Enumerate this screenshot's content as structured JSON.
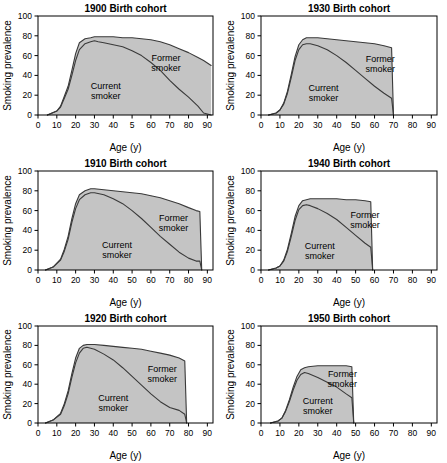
{
  "figure": {
    "axis_labels": {
      "x": "Age (y)",
      "y": "Smoking prevalence"
    },
    "band_labels": {
      "current": "Current smoker",
      "former": "Former smoker"
    },
    "colors": {
      "fill": "#c8c8c8",
      "line": "#3a3a3a",
      "axis": "#000000",
      "background": "#ffffff"
    }
  },
  "chart_data": [
    {
      "type": "area",
      "title": "1900 Birth cohort",
      "xlabel": "Age (y)",
      "ylabel": "Smoking prevalence",
      "xlim": [
        0,
        93
      ],
      "ylim": [
        0,
        100
      ],
      "xticks": [
        0,
        10,
        20,
        30,
        40,
        50,
        60,
        70,
        80,
        90
      ],
      "xticklabels": [
        "0",
        "10",
        "20",
        "30",
        "40",
        "5",
        "60",
        "70",
        "80",
        "90"
      ],
      "yticks": [
        0,
        20,
        40,
        60,
        80,
        100
      ],
      "grid": false,
      "legend": "inline-annotations",
      "x": [
        5,
        10,
        12,
        14,
        16,
        18,
        20,
        22,
        25,
        28,
        30,
        32,
        35,
        40,
        45,
        50,
        55,
        60,
        65,
        70,
        75,
        80,
        85,
        88,
        92
      ],
      "series": [
        {
          "name": "Current smoker",
          "values": [
            0,
            4,
            8,
            17,
            26,
            40,
            55,
            66,
            72,
            74,
            75,
            74,
            73,
            71,
            69,
            65,
            60,
            53,
            45,
            35,
            26,
            18,
            9,
            2,
            0
          ]
        },
        {
          "name": "Total (Current + Former)",
          "values": [
            0,
            4,
            9,
            19,
            29,
            45,
            62,
            73,
            77,
            78,
            79,
            79,
            79,
            79,
            78,
            78,
            77,
            76,
            74,
            71,
            67,
            63,
            58,
            55,
            50
          ]
        }
      ]
    },
    {
      "type": "area",
      "title": "1930 Birth cohort",
      "xlabel": "Age (y)",
      "ylabel": "Smoking prevalence",
      "xlim": [
        0,
        93
      ],
      "ylim": [
        0,
        100
      ],
      "xticks": [
        0,
        10,
        20,
        30,
        40,
        50,
        60,
        70,
        80,
        90
      ],
      "xticklabels": [
        "0",
        "10",
        "20",
        "30",
        "40",
        "50",
        "60",
        "70",
        "80",
        "90"
      ],
      "yticks": [
        0,
        20,
        40,
        60,
        80,
        100
      ],
      "grid": false,
      "legend": "inline-annotations",
      "x": [
        4,
        8,
        10,
        12,
        14,
        16,
        18,
        20,
        22,
        24,
        26,
        30,
        35,
        40,
        45,
        50,
        55,
        60,
        65,
        69,
        70
      ],
      "series": [
        {
          "name": "Current smoker",
          "values": [
            0,
            2,
            5,
            11,
            22,
            38,
            55,
            66,
            71,
            72,
            72,
            70,
            66,
            60,
            53,
            45,
            37,
            29,
            22,
            17,
            0
          ]
        },
        {
          "name": "Total (Current + Former)",
          "values": [
            0,
            2,
            5,
            12,
            24,
            41,
            59,
            71,
            76,
            78,
            78,
            78,
            77,
            76,
            75,
            74,
            73,
            72,
            70,
            68,
            0
          ]
        }
      ]
    },
    {
      "type": "area",
      "title": "1910 Birth cohort",
      "xlabel": "Age (y)",
      "ylabel": "Smoking prevalence",
      "xlim": [
        0,
        93
      ],
      "ylim": [
        0,
        100
      ],
      "xticks": [
        0,
        10,
        20,
        30,
        40,
        50,
        60,
        70,
        80,
        90
      ],
      "xticklabels": [
        "0",
        "10",
        "20",
        "30",
        "40",
        "50",
        "60",
        "70",
        "80",
        "90"
      ],
      "yticks": [
        0,
        20,
        40,
        60,
        80,
        100
      ],
      "grid": false,
      "legend": "inline-annotations",
      "x": [
        4,
        8,
        12,
        14,
        16,
        18,
        20,
        22,
        25,
        28,
        30,
        35,
        40,
        45,
        50,
        55,
        60,
        65,
        70,
        75,
        80,
        84,
        86,
        87
      ],
      "series": [
        {
          "name": "Current smoker",
          "values": [
            0,
            3,
            10,
            19,
            31,
            48,
            62,
            71,
            76,
            78,
            78,
            76,
            72,
            67,
            60,
            52,
            43,
            34,
            26,
            18,
            12,
            9,
            9,
            0
          ]
        },
        {
          "name": "Total (Current + Former)",
          "values": [
            0,
            3,
            11,
            21,
            34,
            52,
            67,
            76,
            80,
            82,
            82,
            81,
            80,
            79,
            78,
            77,
            75,
            73,
            70,
            67,
            63,
            60,
            59,
            0
          ]
        }
      ]
    },
    {
      "type": "area",
      "title": "1940 Birth cohort",
      "xlabel": "Age (y)",
      "ylabel": "Smoking prevalence",
      "xlim": [
        0,
        93
      ],
      "ylim": [
        0,
        100
      ],
      "xticks": [
        0,
        10,
        20,
        30,
        40,
        50,
        60,
        70,
        80,
        90
      ],
      "xticklabels": [
        "0",
        "10",
        "20",
        "30",
        "40",
        "50",
        "60",
        "70",
        "80",
        "90"
      ],
      "yticks": [
        0,
        20,
        40,
        60,
        80,
        100
      ],
      "grid": false,
      "legend": "inline-annotations",
      "x": [
        4,
        8,
        10,
        12,
        14,
        16,
        18,
        20,
        22,
        24,
        26,
        30,
        35,
        40,
        45,
        50,
        55,
        58,
        59
      ],
      "series": [
        {
          "name": "Current smoker",
          "values": [
            0,
            2,
            4,
            9,
            19,
            34,
            50,
            61,
            65,
            66,
            65,
            62,
            57,
            51,
            43,
            35,
            27,
            23,
            0
          ]
        },
        {
          "name": "Total (Current + Former)",
          "values": [
            0,
            2,
            4,
            10,
            21,
            37,
            54,
            65,
            70,
            71,
            72,
            72,
            72,
            72,
            71,
            71,
            70,
            69,
            0
          ]
        }
      ]
    },
    {
      "type": "area",
      "title": "1920 Birth cohort",
      "xlabel": "Age (y)",
      "ylabel": "Smoking prevalence",
      "xlim": [
        0,
        93
      ],
      "ylim": [
        0,
        100
      ],
      "xticks": [
        0,
        10,
        20,
        30,
        40,
        50,
        60,
        70,
        80,
        90
      ],
      "xticklabels": [
        "0",
        "10",
        "20",
        "30",
        "40",
        "50",
        "60",
        "70",
        "80",
        "90"
      ],
      "yticks": [
        0,
        20,
        40,
        60,
        80,
        100
      ],
      "grid": false,
      "legend": "inline-annotations",
      "x": [
        4,
        8,
        12,
        14,
        16,
        18,
        20,
        22,
        24,
        26,
        30,
        35,
        40,
        45,
        50,
        55,
        60,
        65,
        70,
        75,
        78,
        79
      ],
      "series": [
        {
          "name": "Current smoker",
          "values": [
            0,
            3,
            9,
            18,
            30,
            47,
            62,
            72,
            77,
            78,
            76,
            71,
            65,
            57,
            48,
            39,
            30,
            22,
            16,
            13,
            9,
            0
          ]
        },
        {
          "name": "Total (Current + Former)",
          "values": [
            0,
            3,
            10,
            20,
            33,
            51,
            67,
            77,
            80,
            81,
            81,
            80,
            79,
            78,
            77,
            76,
            74,
            72,
            70,
            67,
            64,
            0
          ]
        }
      ]
    },
    {
      "type": "area",
      "title": "1950 Birth cohort",
      "xlabel": "Age (y)",
      "ylabel": "Smoking prevalence",
      "xlim": [
        0,
        93
      ],
      "ylim": [
        0,
        100
      ],
      "xticks": [
        0,
        10,
        20,
        30,
        40,
        50,
        60,
        70,
        80,
        90
      ],
      "xticklabels": [
        "0",
        "10",
        "20",
        "30",
        "40",
        "50",
        "60",
        "70",
        "80",
        "90"
      ],
      "yticks": [
        0,
        20,
        40,
        60,
        80,
        100
      ],
      "grid": false,
      "legend": "inline-annotations",
      "x": [
        5,
        9,
        11,
        13,
        15,
        17,
        19,
        21,
        23,
        25,
        30,
        35,
        40,
        45,
        48,
        49
      ],
      "series": [
        {
          "name": "Current smoker",
          "values": [
            0,
            2,
            5,
            12,
            22,
            34,
            44,
            50,
            52,
            51,
            47,
            42,
            37,
            30,
            26,
            0
          ]
        },
        {
          "name": "Total (Current + Former)",
          "values": [
            0,
            2,
            5,
            13,
            24,
            37,
            48,
            55,
            57,
            58,
            59,
            59,
            59,
            59,
            58,
            0
          ]
        }
      ]
    }
  ],
  "panel_annotations": [
    {
      "current": {
        "x": 36,
        "y": 26
      },
      "former": {
        "x": 68,
        "y": 55
      }
    },
    {
      "current": {
        "x": 33,
        "y": 24
      },
      "former": {
        "x": 63,
        "y": 54
      }
    },
    {
      "current": {
        "x": 42,
        "y": 22
      },
      "former": {
        "x": 72,
        "y": 50
      }
    },
    {
      "current": {
        "x": 31,
        "y": 21
      },
      "former": {
        "x": 55,
        "y": 53
      }
    },
    {
      "current": {
        "x": 40,
        "y": 23
      },
      "former": {
        "x": 66,
        "y": 53
      }
    },
    {
      "current": {
        "x": 30,
        "y": 20
      },
      "former": {
        "x": 43,
        "y": 47
      }
    }
  ]
}
